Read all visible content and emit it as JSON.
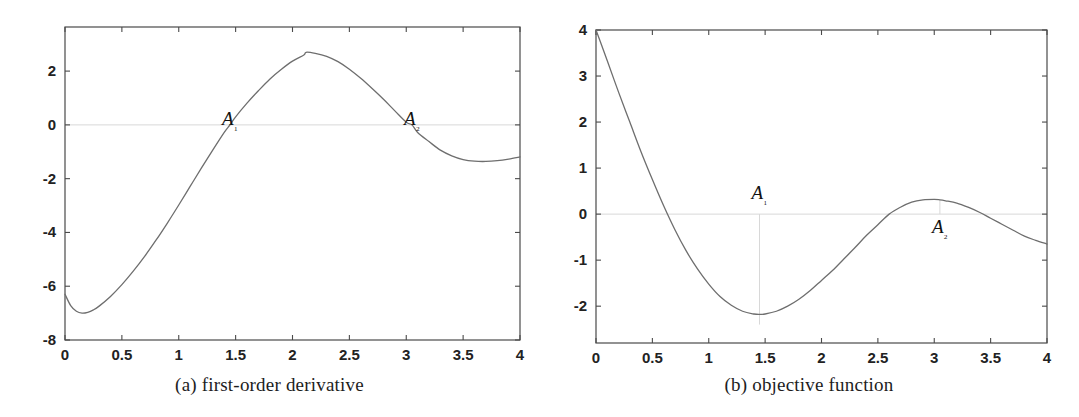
{
  "figure": {
    "panels": [
      {
        "id": "panel-a",
        "caption": "(a) first-order derivative",
        "annotations": [
          {
            "label": "A",
            "sub": "1",
            "x": 1.45,
            "y": 0.0,
            "label_px": {
              "x": 212,
              "y": 112
            }
          },
          {
            "label": "A",
            "sub": "2",
            "x": 3.05,
            "y": 0.0,
            "label_px": {
              "x": 425,
              "y": 112
            }
          }
        ]
      },
      {
        "id": "panel-b",
        "caption": "(b) objective function",
        "annotations": [
          {
            "label": "A",
            "sub": "1",
            "x": 1.45,
            "y": -2.4,
            "label_px": {
              "x": 760,
              "y": 206
            }
          },
          {
            "label": "A",
            "sub": "2",
            "x": 3.05,
            "y": 0.31,
            "label_px": {
              "x": 955,
              "y": 239
            }
          }
        ]
      }
    ]
  },
  "chart_data": [
    {
      "type": "line",
      "title": "(a) first-order derivative",
      "xlabel": "",
      "ylabel": "",
      "xlim": [
        0,
        4
      ],
      "ylim": [
        -8,
        3.64
      ],
      "grid": false,
      "legend": "none",
      "xticks": [
        0,
        0.5,
        1,
        1.5,
        2,
        2.5,
        3,
        3.5,
        4
      ],
      "xticklabels": [
        "0",
        "0.5",
        "1",
        "1.5",
        "2",
        "2.5",
        "3",
        "3.5",
        "4"
      ],
      "yticks": [
        -8,
        -6,
        -4,
        -2,
        0,
        2
      ],
      "yticklabels": [
        "-8",
        "-6",
        "-4",
        "-2",
        "0",
        "2"
      ],
      "zero_line": 0,
      "series": [
        {
          "name": "f'(x)",
          "x": [
            0.0,
            0.05,
            0.1,
            0.15,
            0.2,
            0.25,
            0.3,
            0.4,
            0.5,
            0.6,
            0.7,
            0.8,
            0.9,
            1.0,
            1.1,
            1.2,
            1.3,
            1.4,
            1.45,
            1.5,
            1.6,
            1.7,
            1.8,
            1.9,
            2.0,
            2.1,
            2.12,
            2.2,
            2.3,
            2.4,
            2.5,
            2.6,
            2.7,
            2.8,
            2.9,
            3.0,
            3.05,
            3.1,
            3.2,
            3.3,
            3.4,
            3.5,
            3.6,
            3.7,
            3.8,
            3.9,
            4.0
          ],
          "y": [
            -6.3,
            -6.72,
            -6.93,
            -7.0,
            -6.97,
            -6.88,
            -6.74,
            -6.38,
            -5.94,
            -5.44,
            -4.89,
            -4.29,
            -3.65,
            -2.98,
            -2.29,
            -1.6,
            -0.93,
            -0.28,
            0.0,
            0.3,
            0.81,
            1.27,
            1.7,
            2.06,
            2.37,
            2.6,
            2.7,
            2.66,
            2.55,
            2.35,
            2.07,
            1.73,
            1.35,
            0.95,
            0.52,
            0.1,
            0.0,
            -0.28,
            -0.62,
            -0.94,
            -1.15,
            -1.29,
            -1.35,
            -1.36,
            -1.33,
            -1.27,
            -1.19
          ]
        }
      ],
      "annotations": [
        {
          "text": "A₁",
          "x": 1.45,
          "y": 0.0
        },
        {
          "text": "A₂",
          "x": 3.05,
          "y": 0.0
        }
      ]
    },
    {
      "type": "line",
      "title": "(b) objective function",
      "xlabel": "",
      "ylabel": "",
      "xlim": [
        0,
        4
      ],
      "ylim": [
        -2.8,
        4.0
      ],
      "grid": false,
      "legend": "none",
      "xticks": [
        0,
        0.5,
        1,
        1.5,
        2,
        2.5,
        3,
        3.5,
        4
      ],
      "xticklabels": [
        "0",
        "0.5",
        "1",
        "1.5",
        "2",
        "2.5",
        "3",
        "3.5",
        "4"
      ],
      "yticks": [
        -2,
        -1,
        0,
        1,
        2,
        3,
        4
      ],
      "yticklabels": [
        "-2",
        "-1",
        "0",
        "1",
        "2",
        "3",
        "4"
      ],
      "zero_line": 0,
      "series": [
        {
          "name": "f(x)",
          "x": [
            0.0,
            0.05,
            0.1,
            0.2,
            0.3,
            0.4,
            0.5,
            0.6,
            0.7,
            0.8,
            0.9,
            1.0,
            1.1,
            1.2,
            1.3,
            1.4,
            1.45,
            1.5,
            1.6,
            1.7,
            1.8,
            1.9,
            2.0,
            2.1,
            2.2,
            2.3,
            2.4,
            2.5,
            2.6,
            2.7,
            2.8,
            2.9,
            3.0,
            3.05,
            3.1,
            3.2,
            3.3,
            3.4,
            3.5,
            3.6,
            3.7,
            3.8,
            3.9,
            4.0
          ],
          "y": [
            4.0,
            3.67,
            3.33,
            2.65,
            2.0,
            1.35,
            0.75,
            0.18,
            -0.34,
            -0.8,
            -1.19,
            -1.52,
            -1.79,
            -1.98,
            -2.11,
            -2.17,
            -2.18,
            -2.17,
            -2.11,
            -2.0,
            -1.85,
            -1.66,
            -1.44,
            -1.22,
            -0.97,
            -0.72,
            -0.46,
            -0.23,
            0.0,
            0.15,
            0.26,
            0.31,
            0.32,
            0.31,
            0.29,
            0.24,
            0.15,
            0.04,
            -0.09,
            -0.22,
            -0.35,
            -0.48,
            -0.57,
            -0.65
          ]
        }
      ],
      "annotations": [
        {
          "text": "A₁",
          "x": 1.45,
          "y": 0.32
        },
        {
          "text": "A₂",
          "x": 3.05,
          "y": -0.42
        }
      ],
      "guides": [
        {
          "type": "vline",
          "x": 1.45,
          "y0": 0.0,
          "y1": -2.4
        },
        {
          "type": "vline",
          "x": 3.05,
          "y0": 0.0,
          "y1": 0.31
        }
      ]
    }
  ],
  "colors": {
    "axis": "#4a4a4a",
    "curve": "#6e6e6e",
    "zero_line": "#d8d8d8",
    "guide": "#d8d8d8",
    "text": "#1a1a1a",
    "background": "#ffffff"
  }
}
